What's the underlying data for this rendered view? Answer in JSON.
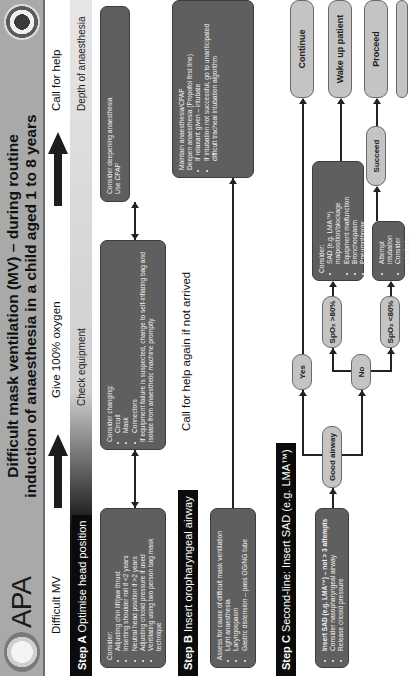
{
  "header": {
    "brand": "APA",
    "title_line1": "Difficult mask ventilation (MV) – during routine",
    "title_line2": "induction of anaesthesia in a child aged 1 to 8 years",
    "left_logo_icon": "apa-child-logo",
    "right_logo_icon": "society-seal-logo"
  },
  "row1": {
    "difficult_mv": "Difficult MV",
    "give_oxygen": "Give 100% oxygen",
    "call_for_help": "Call for help"
  },
  "step_a": {
    "label_bold": "Step A",
    "label_rest": " Optimise head position",
    "check_equipment": "Check equipment",
    "depth": "Depth of anaesthesia",
    "box1": {
      "intro": "Consider:",
      "items": [
        "Adjusting chin lift/jaw thrust",
        "Inserting shoulder roll if <2 years",
        "Neutral head position if >2 years",
        "Adjusting cricoid pressure if used",
        "Ventilating using two person bag mask technique"
      ]
    },
    "box2": {
      "intro": "Consider changing:",
      "items": [
        "Circuit",
        "Mask",
        "Connectors"
      ],
      "outro": "If equipment failure is suspected, change to self-inflating bag and isolate from anaesthetic machine promptly"
    },
    "box3": {
      "line1": "Consider deepening anaesthesia",
      "line2": "Use CPAP"
    }
  },
  "step_b": {
    "label_bold": "Step B",
    "label_rest": " Insert oropharyngeal airway",
    "call_again": "Call for help again if not arrived",
    "box1": {
      "intro": "Assess for cause of difficult mask ventilation",
      "items": [
        "Light anaesthesia",
        "Laryngospasm",
        "Gastric distension – pass OG/NG tube"
      ]
    },
    "box2": {
      "line1": "Maintain anaesthesia/CPAP",
      "line2": "Deepen anaesthesia (Propofol first line)",
      "items": [
        "If relaxant given – intubate",
        "If intubation not successful, go to unanticipated difficult tracheal intubation algorithm"
      ]
    }
  },
  "step_c": {
    "label_bold": "Step C",
    "label_rest": " Second-line: Insert SAD (e.g. LMA™)",
    "box1": {
      "items": [
        "Insert SAD (e.g. LMA™) – not > 3 attempts",
        "Consider nasopharyngeal airway",
        "Release cricoid pressure"
      ]
    },
    "good_airway": "Good airway",
    "yes": "Yes",
    "no": "No",
    "spo2_high": "SpO₂ >80%",
    "spo2_low": "SpO₂ <80%",
    "consider_box": {
      "intro": "Consider:",
      "items": [
        "SAD (e.g. LMA™) malposition/blockage",
        "Equipment malfunction",
        "Bronchospasm",
        "Pneumothorax"
      ]
    },
    "attempt_box": {
      "items": [
        "Attempt intubation",
        "Consider paralysis"
      ]
    },
    "succeed": "Succeed",
    "outcomes": {
      "continue": "Continue",
      "wake_up": "Wake up patient",
      "proceed": "Proceed"
    }
  },
  "colors": {
    "header_bg": "#a9a9a9",
    "dark_box": "#5f5f5f",
    "light_box": "#c4c4c4",
    "step_label_bg": "#0b0b0b"
  }
}
